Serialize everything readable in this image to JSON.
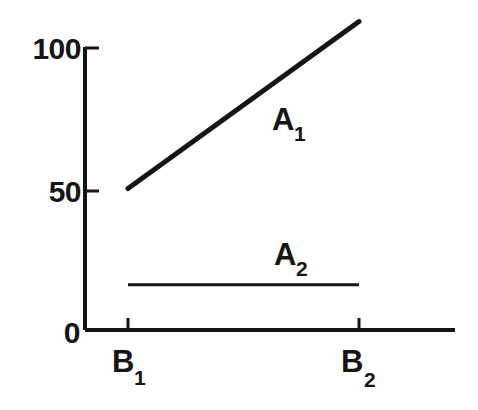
{
  "chart_data": {
    "type": "line",
    "title": "",
    "subtitle": "",
    "xlabel": "",
    "ylabel": "",
    "categories": [
      "B1",
      "B2"
    ],
    "x_tick_labels": [
      "B",
      "B"
    ],
    "x_tick_subscripts": [
      "1",
      "2"
    ],
    "y_tick_labels": [
      "0",
      "50",
      "100"
    ],
    "y_tick_values": [
      0,
      50,
      100
    ],
    "ylim": [
      0,
      115
    ],
    "xlim": [
      0,
      1
    ],
    "grid": false,
    "legend": "inline-labels",
    "legend_position": "inline",
    "series": [
      {
        "name": "A1",
        "name_main": "A",
        "name_subscript": "1",
        "values": [
          50,
          109
        ],
        "color": "#151515",
        "label_x": 0.63,
        "label_y": 76
      },
      {
        "name": "A2",
        "name_main": "A",
        "name_subscript": "2",
        "values": [
          16,
          16
        ],
        "color": "#151515",
        "label_x": 0.65,
        "label_y": 31
      }
    ],
    "style": {
      "axis_color": "#151515",
      "line_color": "#151515",
      "background": "#ffffff",
      "axis_width_px": 4,
      "series1_width_px": 5,
      "series2_width_px": 3,
      "tick_width_px": 3
    }
  },
  "geometry": {
    "axis_x_px": 85,
    "axis_top_px": 47,
    "axis_bottom_px": 330,
    "axis_right_px": 455,
    "b1_x_px": 128,
    "b2_x_px": 359,
    "y0_px": 330,
    "y50_px": 190,
    "y100_px": 47
  }
}
